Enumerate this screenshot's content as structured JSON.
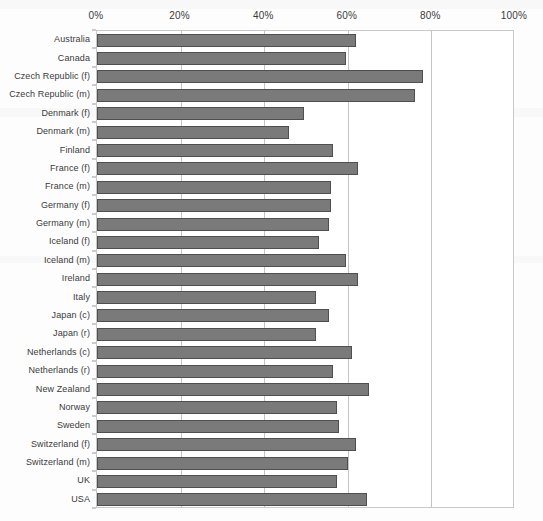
{
  "chart_data": {
    "type": "bar",
    "orientation": "horizontal",
    "title": "",
    "subtitle": "",
    "xlabel": "",
    "ylabel": "",
    "xlim": [
      0,
      100
    ],
    "ylim": null,
    "grid": true,
    "legend": null,
    "legend_position": "none",
    "axis_position": "top",
    "tick_labels": [
      "0%",
      "20%",
      "40%",
      "60%",
      "80%",
      "100%"
    ],
    "tick_values": [
      0,
      20,
      40,
      60,
      80,
      100
    ],
    "categories": [
      "Australia",
      "Canada",
      "Czech Republic (f)",
      "Czech Republic (m)",
      "Denmark (f)",
      "Denmark (m)",
      "Finland",
      "France (f)",
      "France (m)",
      "Germany (f)",
      "Germany (m)",
      "Iceland (f)",
      "Iceland (m)",
      "Ireland",
      "Italy",
      "Japan (c)",
      "Japan (r)",
      "Netherlands (c)",
      "Netherlands (r)",
      "New Zealand",
      "Norway",
      "Sweden",
      "Switzerland (f)",
      "Switzerland (m)",
      "UK",
      "USA"
    ],
    "values": [
      62.0,
      59.5,
      78.0,
      76.0,
      49.5,
      46.0,
      56.5,
      62.5,
      56.0,
      56.0,
      55.5,
      53.0,
      59.5,
      62.5,
      52.5,
      55.5,
      52.5,
      61.0,
      56.5,
      65.0,
      57.5,
      58.0,
      62.0,
      60.0,
      57.5,
      64.5
    ],
    "colors": {
      "bar_fill": "#7a7a7a",
      "bar_border": "#4f4f4f",
      "gridline": "#c4c4c4",
      "plot_border": "#c9c9c9",
      "text": "#3b3b3b",
      "background": "#ffffff"
    }
  }
}
